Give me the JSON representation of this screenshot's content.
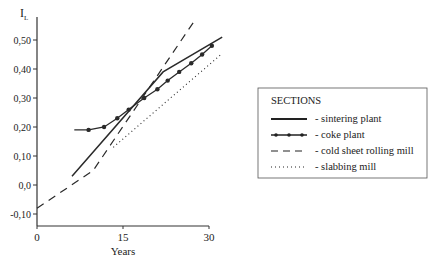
{
  "chart_data": {
    "type": "line",
    "title": "",
    "xlabel": "Years",
    "ylabel": "I_L",
    "xlim": [
      0,
      30
    ],
    "ylim": [
      -0.14,
      0.55
    ],
    "x_ticks": [
      "0",
      "15",
      "30"
    ],
    "y_ticks": [
      "0,50",
      "0,40",
      "0,30",
      "0,20",
      "0,10",
      "0,0",
      "-0,10"
    ],
    "grid": false,
    "legend_position": "right",
    "legend_title": "SECTIONS",
    "series": [
      {
        "name": "sintering plant",
        "style": "solid",
        "points": [
          [
            6.1,
            0.03
          ],
          [
            22.0,
            0.39
          ],
          [
            32.3,
            0.51
          ]
        ]
      },
      {
        "name": "coke plant",
        "style": "solid-markers",
        "points": [
          [
            6.5,
            0.19
          ],
          [
            9.0,
            0.19
          ],
          [
            11.7,
            0.2
          ],
          [
            14.0,
            0.23
          ],
          [
            16.0,
            0.26
          ],
          [
            18.7,
            0.3
          ],
          [
            21.0,
            0.33
          ],
          [
            22.8,
            0.36
          ],
          [
            24.8,
            0.39
          ],
          [
            26.9,
            0.42
          ],
          [
            28.8,
            0.45
          ],
          [
            30.5,
            0.48
          ]
        ]
      },
      {
        "name": "cold sheet rolling mill",
        "style": "dashed",
        "points": [
          [
            0.0,
            -0.08
          ],
          [
            9.8,
            0.05
          ],
          [
            27.6,
            0.57
          ]
        ]
      },
      {
        "name": "slabbing mill",
        "style": "dotted",
        "points": [
          [
            13.3,
            0.13
          ],
          [
            32.1,
            0.45
          ]
        ]
      }
    ]
  },
  "axes": {
    "y_label_main": "I",
    "y_label_sub": "L",
    "x_label": "Years",
    "x_ticks": [
      {
        "label": "0",
        "value": 0
      },
      {
        "label": "15",
        "value": 15
      },
      {
        "label": "30",
        "value": 30
      }
    ],
    "y_ticks": [
      {
        "label": "0,50",
        "value": 0.5
      },
      {
        "label": "0,40",
        "value": 0.4
      },
      {
        "label": "0,30",
        "value": 0.3
      },
      {
        "label": "0,20",
        "value": 0.2
      },
      {
        "label": "0,10",
        "value": 0.1
      },
      {
        "label": "0,0",
        "value": 0.0
      },
      {
        "label": "-0,10",
        "value": -0.1
      }
    ]
  },
  "legend": {
    "title": "SECTIONS",
    "items": [
      {
        "label": "- sintering plant"
      },
      {
        "label": "- coke plant"
      },
      {
        "label": "- cold sheet rolling mill"
      },
      {
        "label": "- slabbing mill"
      }
    ]
  },
  "colors": {
    "line": "#2a2a2a",
    "axis": "#333333",
    "legend_border": "#555555"
  }
}
